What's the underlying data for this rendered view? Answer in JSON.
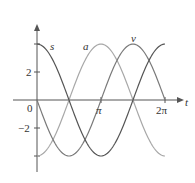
{
  "chart_data": {
    "type": "line",
    "title": "",
    "xlabel": "t",
    "ylabel": "",
    "xlim": [
      0,
      6.2832
    ],
    "ylim": [
      -4,
      4
    ],
    "grid": false,
    "legend": "inline labels near curves",
    "x_ticks": [
      {
        "value": 0,
        "label": "0"
      },
      {
        "value": 3.1416,
        "label": "π"
      },
      {
        "value": 6.2832,
        "label": "2π"
      }
    ],
    "y_ticks": [
      {
        "value": 4,
        "label": ""
      },
      {
        "value": 2,
        "label": "2"
      },
      {
        "value": -2,
        "label": "−2"
      },
      {
        "value": -4,
        "label": ""
      }
    ],
    "series": [
      {
        "name": "s",
        "formula": "4cos(t)",
        "color": "#555555",
        "x": [
          0,
          1.5708,
          3.1416,
          4.7124,
          6.2832
        ],
        "values": [
          4,
          0,
          -4,
          0,
          4
        ]
      },
      {
        "name": "v",
        "formula": "-4sin(t)",
        "color": "#7a7a7a",
        "x": [
          0,
          1.5708,
          3.1416,
          4.7124,
          6.2832
        ],
        "values": [
          0,
          -4,
          0,
          4,
          0
        ]
      },
      {
        "name": "a",
        "formula": "-4cos(t)",
        "color": "#a8a8a8",
        "x": [
          0,
          1.5708,
          3.1416,
          4.7124,
          6.2832
        ],
        "values": [
          -4,
          0,
          4,
          0,
          -4
        ]
      }
    ]
  },
  "labels": {
    "x_axis": "t",
    "origin": "0",
    "pi": "π",
    "two_pi": "2π",
    "y_pos2": "2",
    "y_neg2": "−2",
    "curve_s": "s",
    "curve_a": "a",
    "curve_v": "v"
  }
}
